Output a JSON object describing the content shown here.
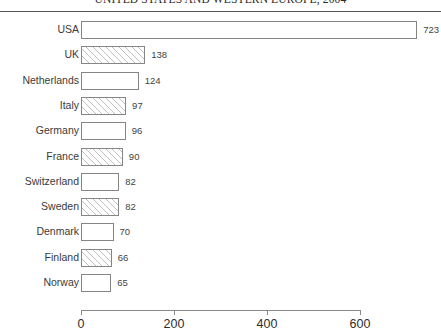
{
  "chart_data": {
    "type": "bar",
    "orientation": "horizontal",
    "title": "UNITED STATES AND WESTERN EUROPE, 2004",
    "xlabel": "",
    "ylabel": "",
    "categories": [
      "USA",
      "UK",
      "Netherlands",
      "Italy",
      "Germany",
      "France",
      "Switzerland",
      "Sweden",
      "Denmark",
      "Finland",
      "Norway"
    ],
    "values": [
      723,
      138,
      124,
      97,
      96,
      90,
      82,
      82,
      70,
      66,
      65
    ],
    "value_labels": [
      "723",
      "138",
      "124",
      "97",
      "96",
      "90",
      "82",
      "82",
      "70",
      "66",
      "65"
    ],
    "bar_fills": [
      "plain",
      "hatched",
      "plain",
      "hatched",
      "plain",
      "hatched",
      "plain",
      "hatched",
      "plain",
      "hatched",
      "plain"
    ],
    "xlim": [
      0,
      600
    ],
    "axis_ticks": [
      0,
      200,
      400,
      600
    ],
    "axis_tick_labels": [
      "0",
      "200",
      "400",
      "600"
    ],
    "grid": false,
    "legend": "none",
    "bar_border_color": "#858585",
    "bar_fill_color": "#ffffff",
    "hatch_color": "#8c8c8c",
    "title_rule_color": "#545454"
  }
}
